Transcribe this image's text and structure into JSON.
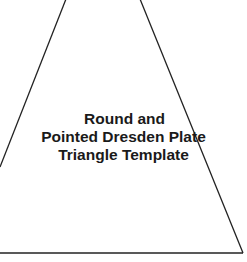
{
  "diagram": {
    "title_lines": [
      "Round and",
      "Pointed Dresden Plate",
      "Triangle Template"
    ],
    "shape": "triangle-template",
    "stroke_color": "#222222",
    "background_color": "#ffffff"
  }
}
